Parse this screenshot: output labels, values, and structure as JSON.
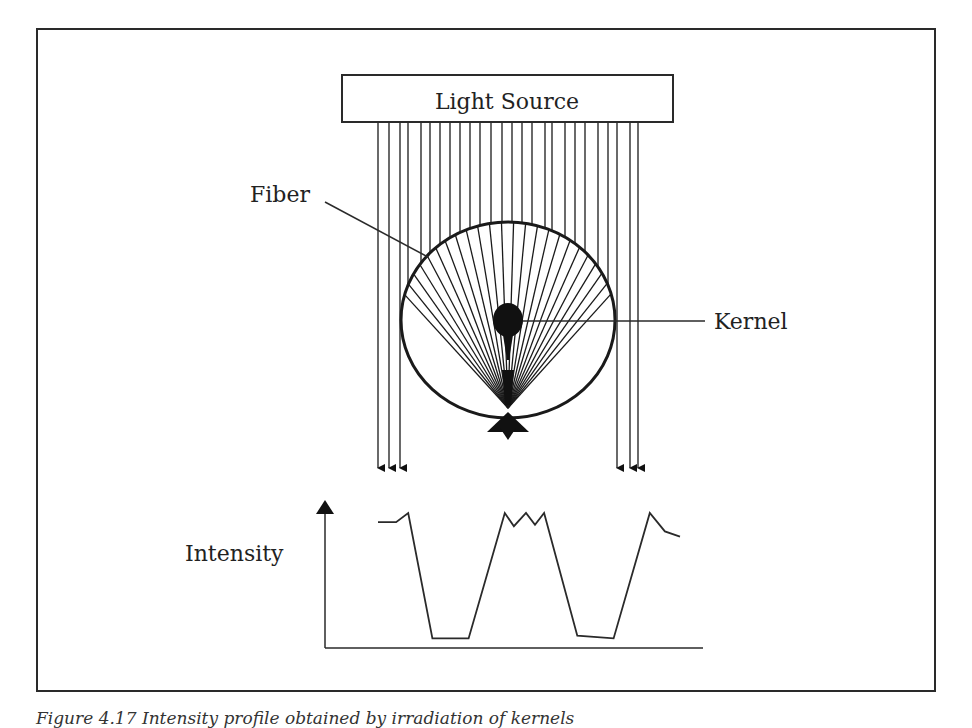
{
  "figure": {
    "labels": {
      "light_source": "Light Source",
      "fiber": "Fiber",
      "kernel": "Kernel",
      "intensity": "Intensity"
    },
    "caption": "Figure 4.17 Intensity profile obtained by irradiation of kernels",
    "colors": {
      "line": "#2a2a2a",
      "fill": "#111111",
      "background": "#ffffff"
    }
  },
  "chart_data": {
    "type": "line",
    "title": "",
    "xlabel": "",
    "ylabel": "Intensity",
    "x": [
      0,
      6,
      10,
      18,
      30,
      42,
      45,
      49,
      52,
      55,
      66,
      78,
      90,
      95,
      100
    ],
    "y": [
      0.9,
      0.9,
      0.97,
      0.02,
      0.02,
      0.97,
      0.87,
      0.97,
      0.88,
      0.97,
      0.04,
      0.02,
      0.97,
      0.83,
      0.79
    ],
    "xlim": [
      0,
      100
    ],
    "ylim": [
      0,
      1
    ],
    "grid": false
  }
}
